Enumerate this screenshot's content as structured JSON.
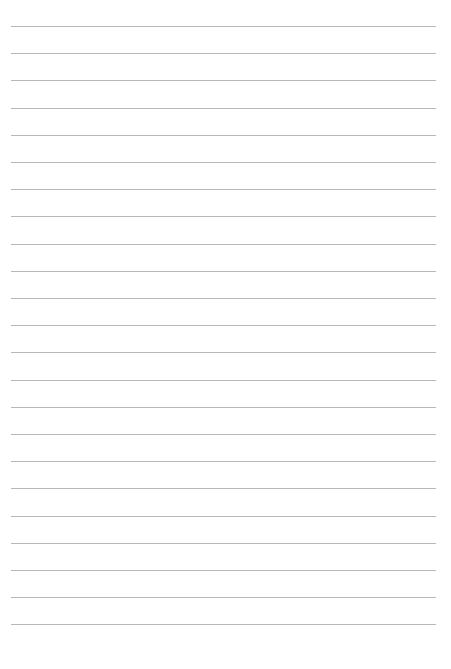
{
  "page": {
    "type": "lined-paper",
    "background_color": "#ffffff",
    "line_color": "#b8b8b8",
    "line_count": 23,
    "first_line_y": 26,
    "line_spacing": 27.2,
    "line_left": 11,
    "line_right": 436
  }
}
